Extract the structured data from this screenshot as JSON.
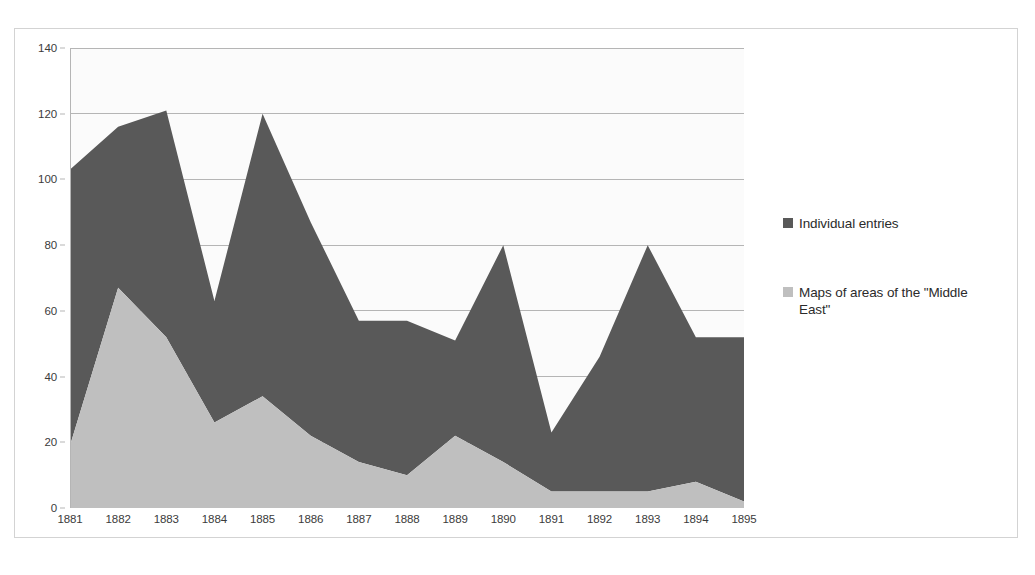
{
  "chart_data": {
    "type": "area",
    "stacked": true,
    "title": "",
    "xlabel": "",
    "ylabel": "",
    "categories": [
      "1881",
      "1882",
      "1883",
      "1884",
      "1885",
      "1886",
      "1887",
      "1888",
      "1889",
      "1890",
      "1891",
      "1892",
      "1893",
      "1894",
      "1895"
    ],
    "series": [
      {
        "name": "Individual entries",
        "color": "#595959",
        "values": [
          84,
          49,
          69,
          37,
          86,
          65,
          43,
          47,
          29,
          66,
          18,
          41,
          75,
          44,
          50
        ]
      },
      {
        "name": "Maps of areas of the \"Middle East\"",
        "color": "#bfbfbf",
        "values": [
          19,
          67,
          52,
          26,
          34,
          22,
          14,
          10,
          22,
          14,
          5,
          5,
          5,
          8,
          2
        ]
      }
    ],
    "totals": [
      103,
      116,
      121,
      63,
      120,
      87,
      57,
      57,
      51,
      80,
      23,
      46,
      80,
      52,
      52
    ],
    "ylim": [
      0,
      140
    ],
    "yticks": [
      0,
      20,
      40,
      60,
      80,
      100,
      120,
      140
    ],
    "grid": true,
    "legend_position": "right",
    "plot_background": "#fbfbfb",
    "gridline_color": "#b5b5b5",
    "axis_color": "#b5b5b5"
  },
  "legend": {
    "entries": [
      {
        "label": "Individual entries"
      },
      {
        "label": "Maps of areas of the \"Middle East\""
      }
    ]
  }
}
